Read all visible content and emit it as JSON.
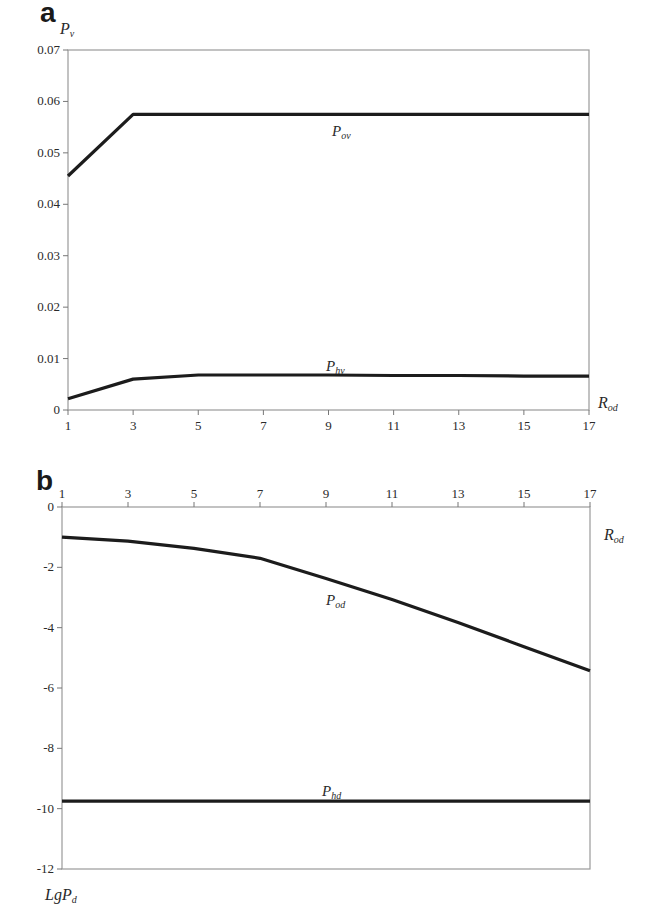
{
  "chart_data": [
    {
      "panel": "a",
      "type": "line",
      "title": "",
      "xlabel": "R_od",
      "ylabel": "P_v",
      "xlim": [
        1,
        17
      ],
      "ylim": [
        0,
        0.07
      ],
      "xticks": [
        1,
        3,
        5,
        7,
        9,
        11,
        13,
        15,
        17
      ],
      "yticks": [
        0,
        0.01,
        0.02,
        0.03,
        0.04,
        0.05,
        0.06,
        0.07
      ],
      "ytick_labels": [
        "0",
        "0.01",
        "0.02",
        "0.03",
        "0.04",
        "0.05",
        "0.06",
        "0.07"
      ],
      "x_axis_position": "bottom",
      "grid": false,
      "legend": "inline labels",
      "x": [
        1,
        3,
        5,
        7,
        9,
        11,
        13,
        15,
        17
      ],
      "series": [
        {
          "name": "P_ov",
          "label_main": "P",
          "label_sub": "ov",
          "values": [
            0.0455,
            0.0575,
            0.0575,
            0.0575,
            0.0575,
            0.0575,
            0.0575,
            0.0575,
            0.0575
          ]
        },
        {
          "name": "P_hv",
          "label_main": "P",
          "label_sub": "hv",
          "values": [
            0.0022,
            0.006,
            0.0068,
            0.0068,
            0.0068,
            0.0067,
            0.0067,
            0.0066,
            0.0066
          ]
        }
      ]
    },
    {
      "panel": "b",
      "type": "line",
      "title": "",
      "xlabel": "R_od",
      "ylabel": "LgP_d",
      "xlim": [
        1,
        17
      ],
      "ylim": [
        -12,
        0
      ],
      "xticks": [
        1,
        3,
        5,
        7,
        9,
        11,
        13,
        15,
        17
      ],
      "yticks": [
        0,
        -2,
        -4,
        -6,
        -8,
        -10,
        -12
      ],
      "ytick_labels": [
        "0",
        "-2",
        "-4",
        "-6",
        "-8",
        "-10",
        "-12"
      ],
      "x_axis_position": "top",
      "grid": false,
      "legend": "inline labels",
      "x": [
        1,
        3,
        5,
        7,
        9,
        11,
        13,
        15,
        17
      ],
      "series": [
        {
          "name": "P_od",
          "label_main": "P",
          "label_sub": "od",
          "values": [
            -1.0,
            -1.13,
            -1.37,
            -1.7,
            -2.37,
            -3.07,
            -3.83,
            -4.63,
            -5.43
          ]
        },
        {
          "name": "P_hd",
          "label_main": "P",
          "label_sub": "hd",
          "values": [
            -9.75,
            -9.75,
            -9.75,
            -9.75,
            -9.75,
            -9.75,
            -9.75,
            -9.75,
            -9.75
          ]
        }
      ]
    }
  ],
  "figure": {
    "panel_a_letter": "a",
    "panel_b_letter": "b",
    "panel_a_ylabel_main": "P",
    "panel_a_ylabel_sub": "v",
    "panel_a_xlabel_main": "R",
    "panel_a_xlabel_sub": "od",
    "panel_b_ylabel_main": "LgP",
    "panel_b_ylabel_sub": "d",
    "panel_b_xlabel_main": "R",
    "panel_b_xlabel_sub": "od"
  }
}
